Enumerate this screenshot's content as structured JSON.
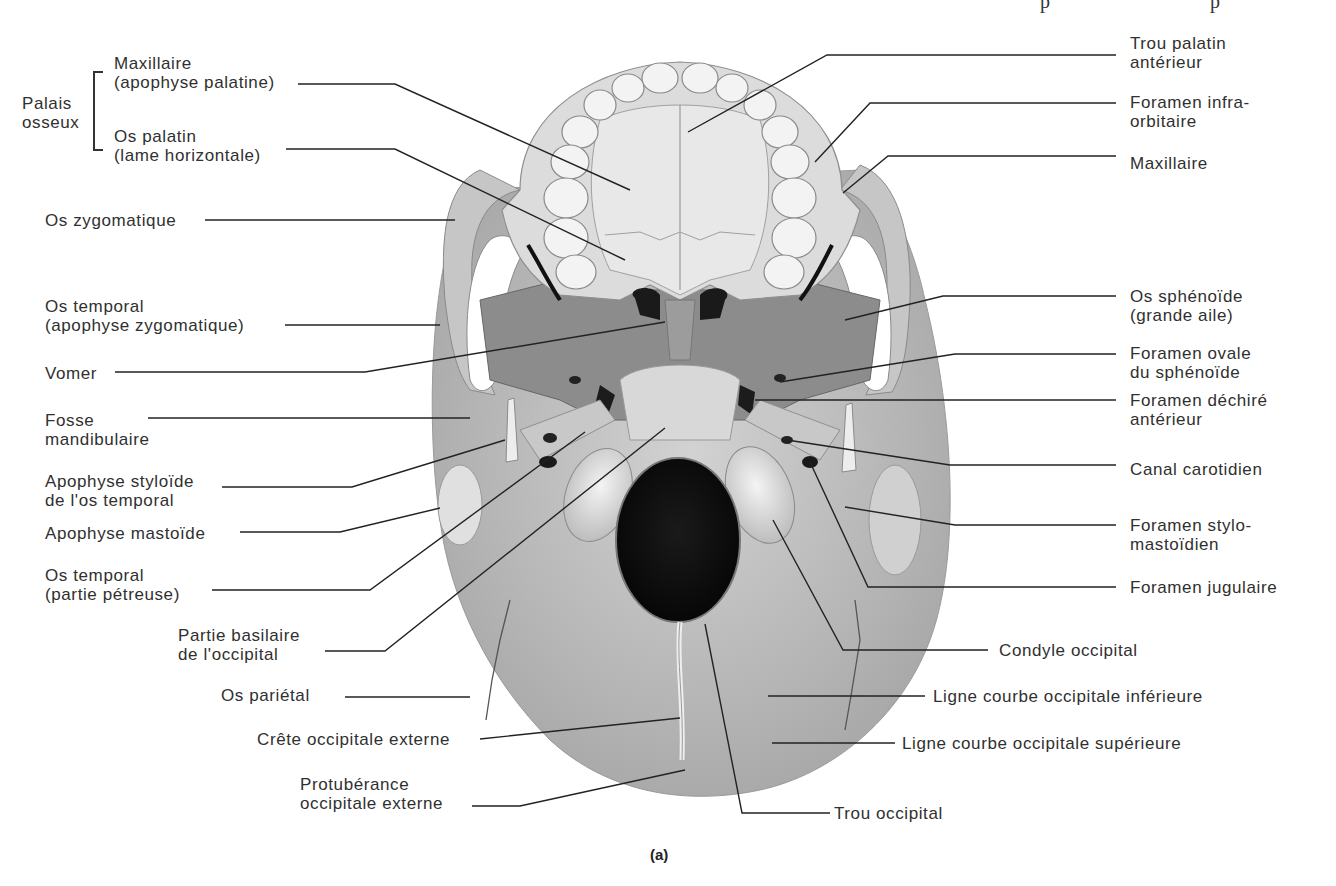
{
  "figure": {
    "caption": "(a)",
    "view": "Vue inférieure du crâne (base du crâne)",
    "colors": {
      "bone_light": "#e4e4e4",
      "bone_mid": "#b9b9b9",
      "bone_dark": "#8e8e8e",
      "foramen": "#111111",
      "leader_line": "#222222",
      "text": "#303030"
    }
  },
  "group_label": {
    "text_line1": "Palais",
    "text_line2": "osseux"
  },
  "labels_left": [
    {
      "id": "maxillaire-apophyse-palatine",
      "line1": "Maxillaire",
      "line2": "(apophyse palatine)"
    },
    {
      "id": "os-palatin",
      "line1": "Os palatin",
      "line2": "(lame horizontale)"
    },
    {
      "id": "os-zygomatique",
      "line1": "Os zygomatique",
      "line2": ""
    },
    {
      "id": "os-temporal-zygomatique",
      "line1": "Os temporal",
      "line2": "(apophyse zygomatique)"
    },
    {
      "id": "vomer",
      "line1": "Vomer",
      "line2": ""
    },
    {
      "id": "fosse-mandibulaire",
      "line1": "Fosse",
      "line2": "mandibulaire"
    },
    {
      "id": "apophyse-styloide",
      "line1": "Apophyse styloïde",
      "line2": "de l'os temporal"
    },
    {
      "id": "apophyse-mastoide",
      "line1": "Apophyse mastoïde",
      "line2": ""
    },
    {
      "id": "os-temporal-petreuse",
      "line1": "Os temporal",
      "line2": "(partie pétreuse)"
    },
    {
      "id": "partie-basilaire",
      "line1": "Partie basilaire",
      "line2": "de l'occipital"
    },
    {
      "id": "os-parietal",
      "line1": "Os pariétal",
      "line2": ""
    },
    {
      "id": "crete-occipitale",
      "line1": "Crête occipitale externe",
      "line2": ""
    },
    {
      "id": "protuberance",
      "line1": "Protubérance",
      "line2": "occipitale externe"
    }
  ],
  "labels_right": [
    {
      "id": "trou-palatin",
      "line1": "Trou palatin",
      "line2": "antérieur"
    },
    {
      "id": "foramen-infra-orbitaire",
      "line1": "Foramen infra-",
      "line2": "orbitaire"
    },
    {
      "id": "maxillaire",
      "line1": "Maxillaire",
      "line2": ""
    },
    {
      "id": "os-sphenoide",
      "line1": "Os sphénoïde",
      "line2": "(grande aile)"
    },
    {
      "id": "foramen-ovale",
      "line1": "Foramen ovale",
      "line2": "du sphénoïde"
    },
    {
      "id": "foramen-dechire",
      "line1": "Foramen déchiré",
      "line2": "antérieur"
    },
    {
      "id": "canal-carotidien",
      "line1": "Canal carotidien",
      "line2": ""
    },
    {
      "id": "foramen-stylo-mastoidien",
      "line1": "Foramen stylo-",
      "line2": "mastoïdien"
    },
    {
      "id": "foramen-jugulaire",
      "line1": "Foramen jugulaire",
      "line2": ""
    },
    {
      "id": "condyle-occipital",
      "line1": "Condyle occipital",
      "line2": ""
    },
    {
      "id": "ligne-courbe-inferieure",
      "line1": "Ligne courbe occipitale inférieure",
      "line2": ""
    },
    {
      "id": "ligne-courbe-superieure",
      "line1": "Ligne courbe occipitale supérieure",
      "line2": ""
    },
    {
      "id": "trou-occipital",
      "line1": "Trou occipital",
      "line2": ""
    }
  ]
}
